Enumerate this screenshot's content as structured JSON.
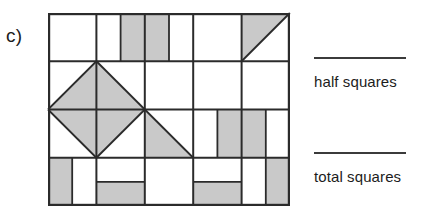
{
  "worksheet": {
    "part_label": "c)",
    "answers": [
      {
        "id": "half-squares",
        "caption": "half squares",
        "value": ""
      },
      {
        "id": "total-squares",
        "caption": "total squares",
        "value": ""
      }
    ]
  },
  "figure": {
    "name": "shaded-square-grid",
    "columns": 5,
    "rows": 4,
    "cell_size": 48.4,
    "colors": {
      "shade": "#c9c9c9",
      "stroke": "#2b2b2b",
      "background": "#ffffff"
    },
    "outline": {
      "x": 0,
      "y": 0,
      "width": 242,
      "height": 193,
      "stroke_width": 2.2
    },
    "grid_lines": {
      "vertical_x": [
        48.4,
        96.8,
        145.2,
        193.6
      ],
      "horizontal_y": [
        48.25,
        96.5,
        144.75
      ]
    },
    "inner_lines": [
      {
        "name": "r1c2-vertical-split",
        "x1": 72.6,
        "y1": 0,
        "x2": 72.6,
        "y2": 48.25
      },
      {
        "name": "r1c3-vertical-split",
        "x1": 121.0,
        "y1": 0,
        "x2": 121.0,
        "y2": 48.25
      },
      {
        "name": "r3c4-vertical-split",
        "x1": 169.4,
        "y1": 96.5,
        "x2": 169.4,
        "y2": 144.75
      },
      {
        "name": "r3c5-vertical-split",
        "x1": 217.8,
        "y1": 96.5,
        "x2": 217.8,
        "y2": 144.75
      },
      {
        "name": "r4c1-vertical-split",
        "x1": 24.2,
        "y1": 144.75,
        "x2": 24.2,
        "y2": 193
      },
      {
        "name": "r4c5-vertical-split",
        "x1": 217.8,
        "y1": 144.75,
        "x2": 217.8,
        "y2": 193
      },
      {
        "name": "r4c2-horizontal-split",
        "x1": 48.4,
        "y1": 168.9,
        "x2": 96.8,
        "y2": 168.9
      },
      {
        "name": "r4c4-horizontal-split",
        "x1": 145.2,
        "y1": 168.9,
        "x2": 193.6,
        "y2": 168.9
      }
    ],
    "shaded_rectangles": [
      {
        "name": "r1c2-right-half",
        "x": 72.6,
        "y": 0,
        "width": 24.2,
        "height": 48.25
      },
      {
        "name": "r1c3-left-half",
        "x": 96.8,
        "y": 0,
        "width": 24.2,
        "height": 48.25
      },
      {
        "name": "r3c4-right-half",
        "x": 169.4,
        "y": 96.5,
        "width": 24.2,
        "height": 48.25
      },
      {
        "name": "r3c5-left-half",
        "x": 193.6,
        "y": 96.5,
        "width": 24.2,
        "height": 48.25
      },
      {
        "name": "r4c1-left-half",
        "x": 0,
        "y": 144.75,
        "width": 24.2,
        "height": 48.25
      },
      {
        "name": "r4c2-bottom-half",
        "x": 48.4,
        "y": 168.9,
        "width": 48.4,
        "height": 24.1
      },
      {
        "name": "r4c4-bottom-half",
        "x": 145.2,
        "y": 168.9,
        "width": 48.4,
        "height": 24.1
      },
      {
        "name": "r4c5-right-half",
        "x": 217.8,
        "y": 144.75,
        "width": 24.2,
        "height": 48.25
      }
    ],
    "shaded_triangles": [
      {
        "name": "r1c5-lower-left-triangle",
        "points": "193.6,0 193.6,48.25 241.85,0"
      },
      {
        "name": "diamond-top-left-triangle",
        "points": "48.4,48.25 0,96.5 48.4,96.5"
      },
      {
        "name": "diamond-top-right-triangle",
        "points": "48.4,48.25 48.4,96.5 96.8,96.5"
      },
      {
        "name": "diamond-bottom-left-triangle",
        "points": "0,96.5 48.4,144.75 48.4,96.5"
      },
      {
        "name": "diamond-bottom-right-triangle",
        "points": "48.4,96.5 48.4,144.75 96.8,96.5"
      },
      {
        "name": "r3c3-lower-right-triangle",
        "points": "96.8,96.5 145.2,144.75 96.8,144.75"
      }
    ],
    "diagonal_lines": [
      {
        "name": "r1c5-diagonal",
        "x1": 193.6,
        "y1": 48.25,
        "x2": 241.85,
        "y2": 0
      },
      {
        "name": "diamond-upper-left-edge",
        "x1": 48.4,
        "y1": 48.25,
        "x2": 0,
        "y2": 96.5
      },
      {
        "name": "diamond-upper-right-edge",
        "x1": 48.4,
        "y1": 48.25,
        "x2": 96.8,
        "y2": 96.5
      },
      {
        "name": "diamond-lower-left-edge",
        "x1": 0,
        "y1": 96.5,
        "x2": 48.4,
        "y2": 144.75
      },
      {
        "name": "diamond-lower-right-edge",
        "x1": 96.8,
        "y1": 96.5,
        "x2": 48.4,
        "y2": 144.75
      },
      {
        "name": "r3c3-diagonal",
        "x1": 96.8,
        "y1": 96.5,
        "x2": 145.2,
        "y2": 144.75
      }
    ]
  }
}
